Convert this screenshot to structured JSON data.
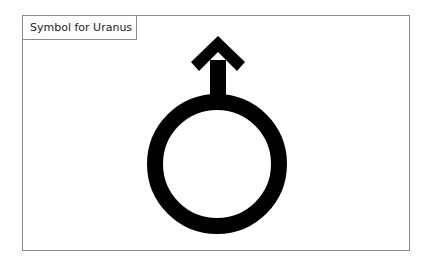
{
  "figure": {
    "title": "Symbol for Uranus",
    "symbol": {
      "name": "uranus-symbol",
      "description": "Circle with upward arrow",
      "color": "#000000"
    },
    "colors": {
      "border": "#8a8a8a",
      "background": "#ffffff"
    }
  }
}
